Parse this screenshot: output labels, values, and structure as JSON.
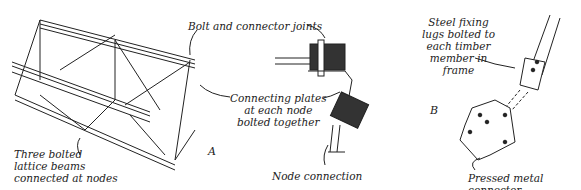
{
  "diagram": {
    "panel_a": {
      "letter": "A",
      "labels": {
        "beams": "Three bolted\nlattice beams\nconnected at nodes",
        "joints": "Bolt and connector joints",
        "plates": "Connecting plates\nat each node\nbolted together",
        "node": "Node connection"
      }
    },
    "panel_b": {
      "letter": "B",
      "labels": {
        "lugs": "Steel fixing\nlugs bolted to\neach timber\nmember in\nframe",
        "connector": "Pressed metal connector"
      }
    }
  }
}
